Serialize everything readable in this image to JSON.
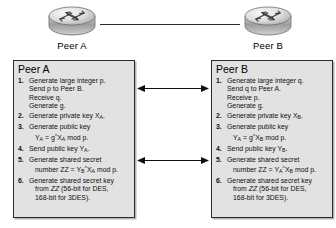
{
  "diagram": {
    "topology": {
      "nodes": [
        {
          "icon": "router-icon",
          "label": "Peer A"
        },
        {
          "icon": "router-icon",
          "label": "Peer B"
        }
      ],
      "link": "network-link-line"
    },
    "arrows": [
      {
        "name": "exchange-arrow-top",
        "style": "double-headed"
      },
      {
        "name": "exchange-arrow-bottom",
        "style": "double-headed"
      }
    ],
    "panel_a": {
      "title": "Peer A",
      "steps": [
        {
          "num": "1.",
          "lines": [
            "Generate large integer p.",
            "Send p to Peer B.",
            "Receive q.",
            "Generate g."
          ]
        },
        {
          "num": "2.",
          "lines": [
            "Generate private key XA."
          ]
        },
        {
          "num": "3.",
          "lines": [
            "Generate public key",
            "YA = gXA mod p."
          ]
        },
        {
          "num": "4.",
          "lines": [
            "Send public key YA."
          ]
        },
        {
          "num": "5.",
          "lines": [
            "Generate shared secret",
            "number ZZ = YBXA mod p."
          ]
        },
        {
          "num": "6.",
          "lines": [
            "Generate shared secret key",
            "from ZZ (56-bit for DES,",
            "168-bit for 3DES)."
          ]
        }
      ]
    },
    "panel_b": {
      "title": "Peer B",
      "steps": [
        {
          "num": "1.",
          "lines": [
            "Generate large integer q.",
            "Send q to Peer A.",
            "Receive p.",
            "Generate g."
          ]
        },
        {
          "num": "2.",
          "lines": [
            "Generate private key XB."
          ]
        },
        {
          "num": "3.",
          "lines": [
            "Generate public key",
            "YA = gXB mod p."
          ]
        },
        {
          "num": "4.",
          "lines": [
            "Send public key YB."
          ]
        },
        {
          "num": "5.",
          "lines": [
            "Generate shared secret",
            "number ZZ = YAXB mod p."
          ]
        },
        {
          "num": "6.",
          "lines": [
            "Generate shared secret key",
            "from ZZ (56-bit for DES,",
            "168-bit for 3DES)."
          ]
        }
      ]
    },
    "colors": {
      "panel_bg": "#e2e2e2",
      "panel_border": "#2b2b2b",
      "line": "#2a2a2a",
      "text": "#000000"
    }
  }
}
